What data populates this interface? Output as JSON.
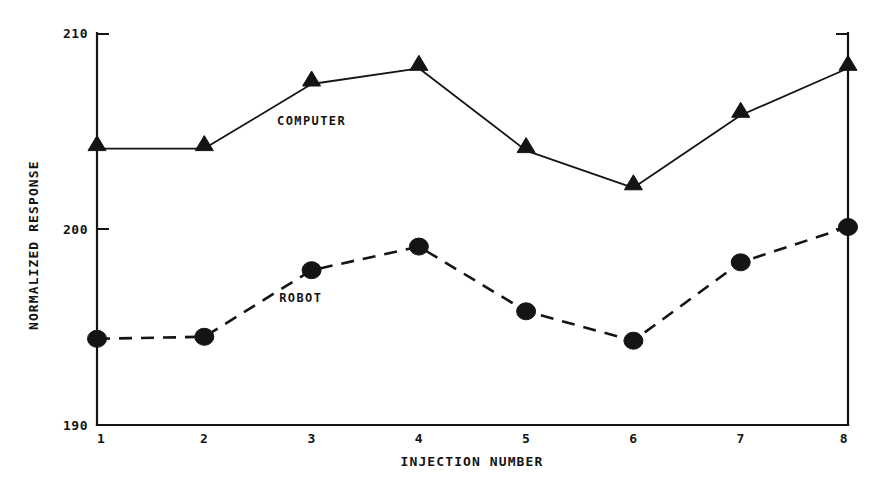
{
  "chart_data": {
    "type": "line",
    "title": "",
    "xlabel": "INJECTION NUMBER",
    "ylabel": "NORMALIZED RESPONSE",
    "x": [
      1,
      2,
      3,
      4,
      5,
      6,
      7,
      8
    ],
    "categories": [
      "1",
      "2",
      "3",
      "4",
      "5",
      "6",
      "7",
      "8"
    ],
    "xlim": [
      1,
      8
    ],
    "ylim": [
      190,
      210
    ],
    "yticks": [
      190,
      200,
      210
    ],
    "ytick_labels": [
      "190",
      "200",
      "210"
    ],
    "xtick_labels": [
      "1",
      "2",
      "3",
      "4",
      "5",
      "6",
      "7",
      "8"
    ],
    "grid": false,
    "legend": "inline-annotations",
    "series": [
      {
        "name": "COMPUTER",
        "marker": "triangle",
        "linestyle": "solid",
        "color": "#141414",
        "values": [
          204.1,
          204.1,
          207.4,
          208.2,
          204.0,
          202.1,
          205.8,
          208.2
        ]
      },
      {
        "name": "ROBOT",
        "marker": "circle",
        "linestyle": "dashed",
        "color": "#141414",
        "values": [
          194.4,
          194.5,
          197.9,
          199.1,
          195.8,
          194.3,
          198.3,
          200.1
        ]
      }
    ],
    "annotations": [
      {
        "text": "COMPUTER",
        "x": 3.0,
        "y": 205.3
      },
      {
        "text": "ROBOT",
        "x": 2.9,
        "y": 196.3
      }
    ]
  }
}
